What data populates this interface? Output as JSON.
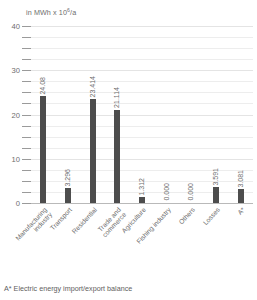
{
  "chart_data": {
    "type": "bar",
    "title": "",
    "unit_label": "in MWh x 10",
    "unit_exponent": "6",
    "unit_suffix": "/a",
    "ylabel": "in MWh x 10^6/a",
    "xlabel": "",
    "ylim": [
      0,
      40
    ],
    "yticks": [
      0,
      10,
      20,
      30,
      40
    ],
    "ytick_labels": [
      "0",
      "10",
      "20",
      "30",
      "40"
    ],
    "minor_tick_step": 2.5,
    "grid": true,
    "legend": "none",
    "bar_color": "#4d4d4d",
    "categories": [
      "Manufacturing industry",
      "Transport",
      "Residential",
      "Trade and commerce",
      "Agriculture",
      "Fishing industry",
      "Others",
      "Losses",
      "A*"
    ],
    "category_lines": [
      [
        "Manufacturing",
        "industry"
      ],
      [
        "Transport"
      ],
      [
        "Residential"
      ],
      [
        "Trade and",
        "commerce"
      ],
      [
        "Agriculture"
      ],
      [
        "Fishing industry"
      ],
      [
        "Others"
      ],
      [
        "Losses"
      ],
      [
        "A*"
      ]
    ],
    "values": [
      24.08,
      3.296,
      23.414,
      21.114,
      1.312,
      0.0,
      0.0,
      3.591,
      3.081
    ],
    "value_labels": [
      "24.08",
      "3.296",
      "23.414",
      "21.114",
      "1.312",
      "0.000",
      "0.000",
      "3.591",
      "3.081"
    ]
  },
  "footnote": "A* Electric energy import/export balance"
}
